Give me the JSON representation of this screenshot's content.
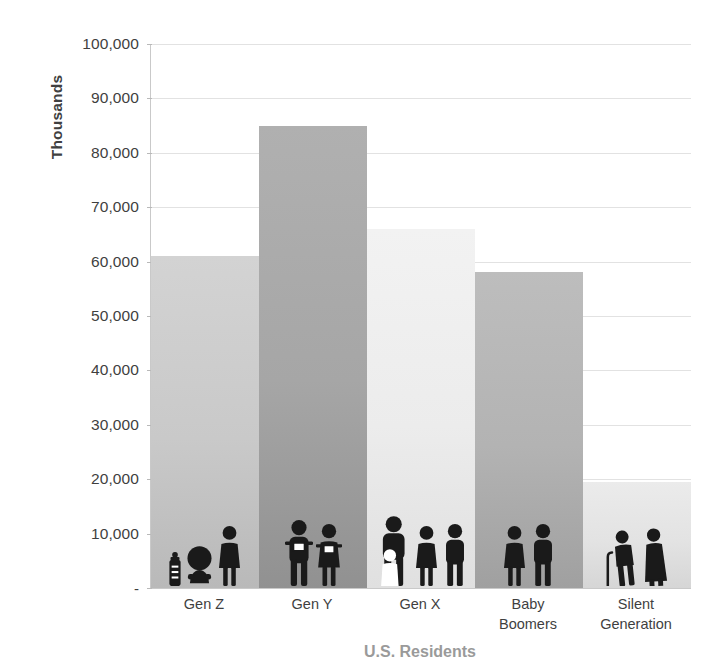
{
  "chart_data": {
    "type": "bar",
    "title": "U.S. Residents",
    "subtitle": "",
    "xlabel": "",
    "ylabel": "Thousands",
    "categories": [
      "Gen Z",
      "Gen Y",
      "Gen X",
      "Baby Boomers",
      "Silent Generation"
    ],
    "values": [
      61000,
      85000,
      66000,
      58000,
      19500
    ],
    "values_display": [
      "61,000",
      "85,000",
      "66,000",
      "58,000",
      "19,500"
    ],
    "series": [
      {
        "name": "U.S. Residents",
        "values": [
          61000,
          85000,
          66000,
          58000,
          19500
        ]
      }
    ],
    "ylim": [
      0,
      100000
    ],
    "y_ticks": [
      0,
      10000,
      20000,
      30000,
      40000,
      50000,
      60000,
      70000,
      80000,
      90000,
      100000
    ],
    "y_tick_labels": [
      "-",
      "10,000",
      "20,000",
      "30,000",
      "40,000",
      "50,000",
      "60,000",
      "70,000",
      "80,000",
      "90,000",
      "100,000"
    ],
    "grid": true,
    "grid_axis": "y",
    "legend": false,
    "legend_position": "none",
    "bar_gap": 0,
    "annotations": [
      "Each bar contains a pictogram of people representing the age group of that generation."
    ]
  },
  "axes": {
    "y_title": "Thousands",
    "y_labels": [
      "100,000",
      "90,000",
      "80,000",
      "70,000",
      "60,000",
      "50,000",
      "40,000",
      "30,000",
      "20,000",
      "10,000",
      "-"
    ],
    "x_labels": [
      {
        "line1": "Gen Z",
        "line2": ""
      },
      {
        "line1": "Gen Y",
        "line2": ""
      },
      {
        "line1": "Gen X",
        "line2": ""
      },
      {
        "line1": "Baby",
        "line2": "Boomers"
      },
      {
        "line1": "Silent",
        "line2": "Generation"
      }
    ]
  },
  "bars": [
    {
      "category": "Gen Z",
      "value": 61000,
      "color": "#c9c9c9",
      "color_top": "#d3d3d3",
      "color_bottom": "#b9b9b9",
      "pictogram": [
        "baby-bottle-icon",
        "baby-icon",
        "woman-icon"
      ]
    },
    {
      "category": "Gen Y",
      "value": 85000,
      "color": "#a6a6a6",
      "color_top": "#b0b0b0",
      "color_bottom": "#919191",
      "pictogram": [
        "young-man-with-device-icon",
        "young-woman-with-device-icon"
      ]
    },
    {
      "category": "Gen X",
      "value": 66000,
      "color": "#ececec",
      "color_top": "#f2f2f2",
      "color_bottom": "#e0e0e0",
      "pictogram": [
        "parent-with-child-icon",
        "woman-icon",
        "man-icon"
      ]
    },
    {
      "category": "Baby Boomers",
      "value": 58000,
      "color": "#b3b3b3",
      "color_top": "#bdbdbd",
      "color_bottom": "#a0a0a0",
      "pictogram": [
        "woman-icon",
        "man-icon"
      ]
    },
    {
      "category": "Silent Generation",
      "value": 19500,
      "color": "#e3e3e3",
      "color_top": "#ebebeb",
      "color_bottom": "#d6d6d6",
      "pictogram": [
        "elderly-man-with-cane-icon",
        "elderly-woman-icon"
      ]
    }
  ],
  "colors": {
    "gridline": "#e2e2e2",
    "axis_line": "#c9c9c9",
    "text": "#3f3f3f",
    "pictogram": "#1a1a1a",
    "background": "#ffffff"
  },
  "bottom_title": "U.S. Residents"
}
